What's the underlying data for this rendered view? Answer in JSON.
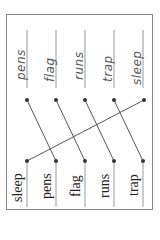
{
  "worksheet": {
    "top_words": [
      "pens",
      "flag",
      "runs",
      "trap",
      "sleep"
    ],
    "bottom_words": [
      "sleep",
      "pens",
      "flag",
      "runs",
      "trap"
    ],
    "top_dot_x": [
      27,
      56,
      85,
      114,
      144
    ],
    "bottom_dot_x": [
      27,
      56,
      85,
      114,
      143
    ],
    "top_dot_y": 100,
    "bottom_dot_y": 161,
    "connections": [
      [
        0,
        1
      ],
      [
        1,
        2
      ],
      [
        2,
        3
      ],
      [
        3,
        4
      ],
      [
        4,
        0
      ]
    ],
    "colors": {
      "frame": "#8a8a8a",
      "line": "#555555",
      "dot": "#333333",
      "rule": "#999999"
    }
  }
}
